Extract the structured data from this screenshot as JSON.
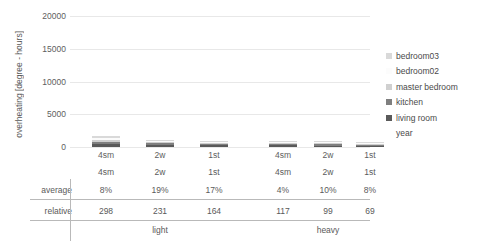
{
  "chart_data": {
    "type": "bar",
    "stacked": true,
    "title": "",
    "xlabel": "",
    "ylabel": "overheating [degree - hours]",
    "ylim": [
      0,
      20000
    ],
    "yticks": [
      0,
      5000,
      10000,
      15000,
      20000
    ],
    "ytick_labels": [
      "0",
      "5000",
      "10000",
      "15000",
      "20000"
    ],
    "grid": true,
    "legend_position": "right",
    "categories": [
      "4sm",
      "2w",
      "1st",
      "4sm",
      "2w",
      "1st"
    ],
    "groups": [
      {
        "label": "light",
        "categories": [
          "4sm",
          "2w",
          "1st"
        ]
      },
      {
        "label": "heavy",
        "categories": [
          "4sm",
          "2w",
          "1st"
        ]
      }
    ],
    "series": [
      {
        "name": "bedroom03",
        "color": "#d9d9d9",
        "values": [
          330,
          120,
          40,
          95,
          40,
          15
        ]
      },
      {
        "name": "bedroom02",
        "color": "#fbfbfb",
        "values": [
          260,
          95,
          30,
          75,
          30,
          10
        ]
      },
      {
        "name": "master bedroom",
        "color": "#cfcfcf",
        "values": [
          300,
          110,
          35,
          85,
          35,
          12
        ]
      },
      {
        "name": "kitchen",
        "color": "#7f7f7f",
        "values": [
          380,
          310,
          240,
          250,
          210,
          170
        ]
      },
      {
        "name": "living room",
        "color": "#595959",
        "values": [
          430,
          340,
          260,
          280,
          230,
          190
        ]
      },
      {
        "name": "year",
        "color": "#ffffff",
        "values": [
          0,
          0,
          0,
          0,
          0,
          0
        ]
      }
    ]
  },
  "axis": {
    "y_title": "overheating [degree - hours]"
  },
  "legend": {
    "items": [
      {
        "label": "bedroom03",
        "color": "#d9d9d9"
      },
      {
        "label": "bedroom02",
        "color": "#fcfcfc"
      },
      {
        "label": "master bedroom",
        "color": "#d0d0d0"
      },
      {
        "label": "kitchen",
        "color": "#7f7f7f"
      },
      {
        "label": "living room",
        "color": "#5a5a5a"
      },
      {
        "label": "year",
        "color": "#ffffff"
      }
    ]
  },
  "table": {
    "header": [
      "4sm",
      "2w",
      "1st",
      "4sm",
      "2w",
      "1st"
    ],
    "rows": [
      {
        "label": "average",
        "values": [
          "8%",
          "19%",
          "17%",
          "4%",
          "10%",
          "8%"
        ]
      },
      {
        "label": "relative",
        "values": [
          "298",
          "231",
          "164",
          "117",
          "99",
          "69"
        ]
      }
    ],
    "group_labels": [
      "light",
      "heavy"
    ]
  }
}
